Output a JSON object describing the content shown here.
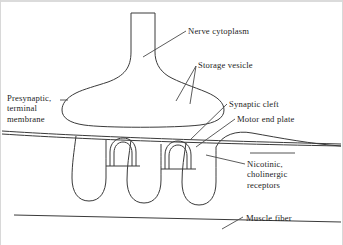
{
  "figure": {
    "background_color": "#ffffff",
    "line_color": "#3a3a3a",
    "text_color": "#1d1d1d",
    "width": 343,
    "height": 245
  },
  "labels": {
    "nerve_cytoplasm": "Nerve cytoplasm",
    "storage_vesicle": "Storage vesicle",
    "presynaptic_terminal_membrane": "Presynaptic,\nterminal\nmembrane",
    "synaptic_cleft": "Synaptic cleft",
    "motor_end_plate": "Motor end plate",
    "nicotinic_cholinergic_receptors": "Nicotinic,\ncholinergic\nreceptors",
    "muscle_fiber": "Muscle fiber"
  },
  "structures": [
    {
      "name": "axon-terminal-bouton",
      "description": "mushroom shaped nerve ending with narrow stalk and wide bulb"
    },
    {
      "name": "synaptic-cleft-gap",
      "description": "narrow slanted gap between presynaptic membrane and motor end plate"
    },
    {
      "name": "junctional-fold",
      "count": 3,
      "description": "downward finger-like infoldings of the muscle membrane"
    },
    {
      "name": "receptor-arch",
      "count": 2,
      "description": "nested inverted-U arches marking receptor clusters"
    },
    {
      "name": "muscle-fiber-boundary",
      "description": "long slanted line at the bottom of the figure"
    }
  ]
}
